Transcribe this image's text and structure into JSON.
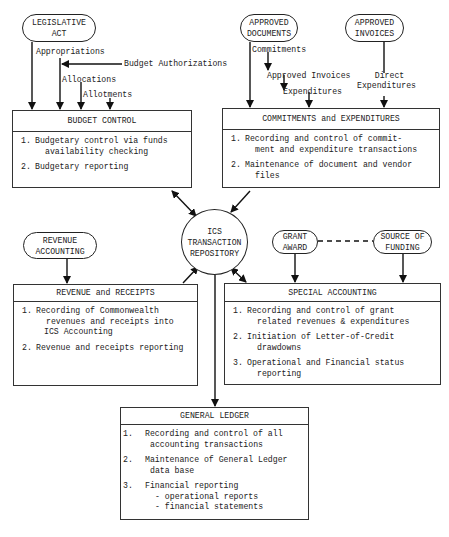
{
  "sources": {
    "legislative_act": [
      "LEGISLATIVE",
      "ACT"
    ],
    "approved_documents": [
      "APPROVED",
      "DOCUMENTS"
    ],
    "approved_invoices": [
      "APPROVED",
      "INVOICES"
    ],
    "revenue_accounting": [
      "REVENUE",
      "ACCOUNTING"
    ],
    "grant_award": [
      "GRANT",
      "AWARD"
    ],
    "source_of_funding": [
      "SOURCE OF",
      "FUNDING"
    ]
  },
  "flow_labels": {
    "appropriations": "Appropriations",
    "budget_authorizations": "Budget Authorizations",
    "allocations": "Allocations",
    "allotments": "Allotments",
    "commitments": "Commitments",
    "approved_invoices": "Approved Invoices",
    "expenditures": "Expenditures",
    "direct_expenditures": [
      "Direct",
      "Expenditures"
    ]
  },
  "repository": [
    "ICS",
    "TRANSACTION",
    "REPOSITORY"
  ],
  "boxes": {
    "budget_control": {
      "title": "BUDGET CONTROL",
      "items": [
        {
          "num": "1.",
          "lines": [
            "Budgetary control via funds",
            "availability checking"
          ]
        },
        {
          "num": "2.",
          "lines": [
            "Budgetary reporting"
          ]
        }
      ]
    },
    "commitments": {
      "title": "COMMITMENTS and EXPENDITURES",
      "items": [
        {
          "num": "1.",
          "lines": [
            "Recording and control of commit-",
            "ment and expenditure transactions"
          ]
        },
        {
          "num": "2.",
          "lines": [
            "Maintenance of document and vendor",
            "files"
          ]
        }
      ]
    },
    "revenue": {
      "title": "REVENUE and RECEIPTS",
      "items": [
        {
          "num": "1.",
          "lines": [
            "Recording of Commonwealth",
            "revenues and receipts into",
            "ICS Accounting"
          ]
        },
        {
          "num": "2.",
          "lines": [
            "Revenue and receipts reporting"
          ]
        }
      ]
    },
    "special": {
      "title": "SPECIAL ACCOUNTING",
      "items": [
        {
          "num": "1.",
          "lines": [
            "Recording and control of grant",
            "related revenues & expenditures"
          ]
        },
        {
          "num": "2.",
          "lines": [
            "Initiation of Letter-of-Credit",
            "drawdowns"
          ]
        },
        {
          "num": "3.",
          "lines": [
            "Operational and Financial status",
            "reporting"
          ]
        }
      ]
    },
    "general_ledger": {
      "title": "GENERAL LEDGER",
      "items": [
        {
          "num": "1.",
          "lines": [
            "Recording and control of all",
            "accounting transactions"
          ]
        },
        {
          "num": "2.",
          "lines": [
            "Maintenance of General Ledger",
            "data base"
          ]
        },
        {
          "num": "3.",
          "lines": [
            "Financial reporting",
            "- operational reports",
            "- financial statements"
          ]
        }
      ]
    }
  }
}
